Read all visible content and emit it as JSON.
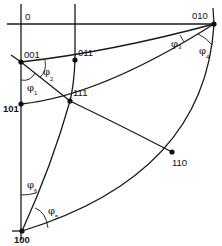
{
  "diagram": {
    "type": "stereographic-projection",
    "origin_label": "0",
    "poles": [
      {
        "id": "001",
        "label": "001"
      },
      {
        "id": "011",
        "label": "011"
      },
      {
        "id": "111",
        "label": "111"
      },
      {
        "id": "101",
        "label": "101"
      },
      {
        "id": "010",
        "label": "010"
      },
      {
        "id": "110",
        "label": "110"
      },
      {
        "id": "100",
        "label": "100"
      }
    ],
    "angles": [
      {
        "id": "phi1",
        "symbol": "φ",
        "sub": "1"
      },
      {
        "id": "phi2",
        "symbol": "φ",
        "sub": "2"
      },
      {
        "id": "phi3",
        "symbol": "φ",
        "sub": "3"
      },
      {
        "id": "phi4",
        "symbol": "φ",
        "sub": "4"
      },
      {
        "id": "phi5",
        "symbol": "φ",
        "sub": "5"
      },
      {
        "id": "phi6",
        "symbol": "φ",
        "sub": "6"
      }
    ]
  }
}
